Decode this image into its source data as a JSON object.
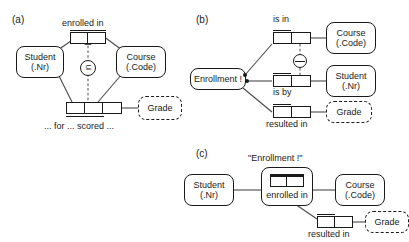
{
  "figure": {
    "type": "orm-diagram"
  },
  "panels": {
    "a": {
      "label": "(a)",
      "entities": [
        {
          "name": "Student",
          "ref": "(.Nr)",
          "dashed": false
        },
        {
          "name": "Course",
          "ref": "(.Code)",
          "dashed": false
        },
        {
          "name": "Grade",
          "ref": "",
          "dashed": true
        }
      ],
      "predicates": [
        {
          "name": "enrolled-in",
          "label": "enrolled in",
          "arity": 2,
          "uniqueness_span": [
            0,
            2
          ]
        },
        {
          "name": "for-scored",
          "label": "... for ... scored ...",
          "arity": 3,
          "uniqueness_span": [
            0,
            2
          ]
        }
      ],
      "constraints": [
        {
          "name": "subset-constraint",
          "symbol": "⊆",
          "kind": "subset"
        }
      ]
    },
    "b": {
      "label": "(b)",
      "entities": [
        {
          "name": "Enrollment",
          "ref": "",
          "display": "Enrollment !",
          "dashed": false
        },
        {
          "name": "Course",
          "ref": "(.Code)",
          "dashed": false
        },
        {
          "name": "Student",
          "ref": "(.Nr)",
          "dashed": false
        },
        {
          "name": "Grade",
          "ref": "",
          "dashed": true
        }
      ],
      "predicates": [
        {
          "name": "is-in",
          "label": "is in",
          "arity": 2,
          "uniqueness_span": [
            0,
            1
          ]
        },
        {
          "name": "is-by",
          "label": "is by",
          "arity": 2,
          "uniqueness_span": [
            0,
            1
          ]
        },
        {
          "name": "resulted-in",
          "label": "resulted in",
          "arity": 2,
          "uniqueness_span": [
            0,
            1
          ]
        }
      ],
      "constraints": [
        {
          "name": "exclusion-constraint",
          "symbol": "⊖",
          "kind": "external-uniqueness"
        }
      ]
    },
    "c": {
      "label": "(c)",
      "objectification_label": "\"Enrollment !\"",
      "entities": [
        {
          "name": "Student",
          "ref": "(.Nr)",
          "dashed": false
        },
        {
          "name": "Course",
          "ref": "(.Code)",
          "dashed": false
        },
        {
          "name": "Grade",
          "ref": "",
          "dashed": true
        }
      ],
      "predicates": [
        {
          "name": "enrolled-in",
          "label": "enrolled in",
          "arity": 2,
          "uniqueness_span": [
            0,
            2
          ]
        },
        {
          "name": "resulted-in",
          "label": "resulted in",
          "arity": 2,
          "uniqueness_span": [
            0,
            1
          ]
        }
      ]
    }
  },
  "colors": {
    "stroke": "#1a1a1a",
    "line": "#4a4a4a",
    "background": "#ffffff"
  }
}
